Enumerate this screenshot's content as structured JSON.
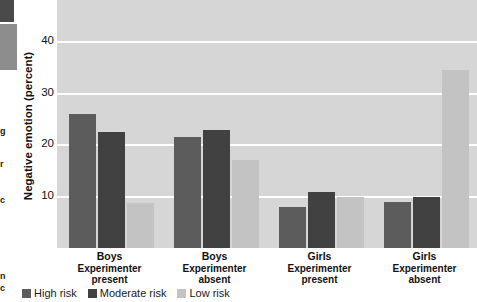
{
  "chart_data": {
    "type": "bar",
    "title": "",
    "xlabel": "",
    "ylabel": "Negative emotion (percent)",
    "ylim": [
      0,
      45
    ],
    "yticks": [
      10,
      20,
      30,
      40
    ],
    "grid": true,
    "legend_position": "bottom-left",
    "categories": [
      {
        "group": "Boys",
        "condition": "Experimenter present"
      },
      {
        "group": "Boys",
        "condition": "Experimenter absent"
      },
      {
        "group": "Girls",
        "condition": "Experimenter present"
      },
      {
        "group": "Girls",
        "condition": "Experimenter absent"
      }
    ],
    "series": [
      {
        "name": "High risk",
        "color": "#5c5c5c",
        "values": [
          26.0,
          21.5,
          8.0,
          9.0
        ]
      },
      {
        "name": "Moderate risk",
        "color": "#414141",
        "values": [
          22.5,
          23.0,
          10.8,
          10.0
        ]
      },
      {
        "name": "Low risk",
        "color": "#c3c3c3",
        "values": [
          8.8,
          17.0,
          10.0,
          34.5
        ]
      }
    ]
  },
  "axis": {
    "y_title": "Negative emotion (percent)",
    "tick_labels": [
      "40",
      "30",
      "20",
      "10"
    ]
  },
  "group_captions": [
    {
      "line1": "Boys",
      "line2": "Experimenter",
      "line3": "present"
    },
    {
      "line1": "Boys",
      "line2": "Experimenter",
      "line3": "absent"
    },
    {
      "line1": "Girls",
      "line2": "Experimenter",
      "line3": "present"
    },
    {
      "line1": "Girls",
      "line2": "Experimenter",
      "line3": "absent"
    }
  ],
  "legend": {
    "items": [
      {
        "label": "High risk",
        "color": "#5c5c5c"
      },
      {
        "label": "Moderate risk",
        "color": "#414141"
      },
      {
        "label": "Low risk",
        "color": "#c3c3c3"
      }
    ]
  },
  "page_edge_fragments": [
    {
      "text": "g",
      "top": 127
    },
    {
      "text": "r",
      "top": 160
    },
    {
      "text": "c",
      "top": 196
    },
    {
      "text": "n",
      "top": 272
    },
    {
      "text": "c",
      "top": 284
    }
  ],
  "colors": {
    "plot_background": "#d6d6d6",
    "gridline": "#ffffff",
    "page_background": "#ffffff",
    "text": "#111111"
  }
}
